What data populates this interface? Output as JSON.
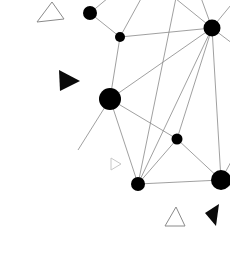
{
  "canvas": {
    "width": 230,
    "height": 267,
    "background": "#ffffff",
    "title": "node-link-graph-scatter"
  },
  "style": {
    "edge_color": "#888888",
    "edge_width": 0.8,
    "node_fill": "#000000",
    "outline_shape_stroke": "#8a8a8a",
    "outline_shape_stroke_light": "#c8c8c8",
    "filled_shape_fill": "#0a0a0a"
  },
  "chart_data": {
    "type": "scatter",
    "title": "",
    "xlabel": "",
    "ylabel": "",
    "xlim": [
      0,
      230
    ],
    "ylim": [
      0,
      267
    ],
    "grid": false,
    "legend": "none",
    "nodes": [
      {
        "id": "n1",
        "x": 90,
        "y": 13,
        "r": 7.0,
        "color": "#000000"
      },
      {
        "id": "n2",
        "x": 120,
        "y": 37,
        "r": 5.0,
        "color": "#000000"
      },
      {
        "id": "n3",
        "x": 212,
        "y": 28,
        "r": 8.5,
        "color": "#000000"
      },
      {
        "id": "n4",
        "x": 110,
        "y": 99,
        "r": 11.0,
        "color": "#000000"
      },
      {
        "id": "n5",
        "x": 177,
        "y": 139,
        "r": 5.5,
        "color": "#000000"
      },
      {
        "id": "n6",
        "x": 138,
        "y": 184,
        "r": 7.0,
        "color": "#000000"
      },
      {
        "id": "n7",
        "x": 221,
        "y": 180,
        "r": 10.0,
        "color": "#000000"
      }
    ],
    "edges": [
      {
        "from": "n1",
        "to": "n2"
      },
      {
        "from": "n2",
        "to": "n3"
      },
      {
        "from": "n2",
        "to": "n4"
      },
      {
        "from": "n3",
        "to": "n4"
      },
      {
        "from": "n3",
        "to": "n5"
      },
      {
        "from": "n3",
        "to": "n6"
      },
      {
        "from": "n3",
        "to": "n7"
      },
      {
        "from": "n4",
        "to": "n5"
      },
      {
        "from": "n4",
        "to": "n6"
      },
      {
        "from": "n5",
        "to": "n6"
      },
      {
        "from": "n5",
        "to": "n7"
      },
      {
        "from": "n6",
        "to": "n7"
      }
    ],
    "open_edges": [
      {
        "from": "n1",
        "x2": 120,
        "y2": -12
      },
      {
        "from": "n3",
        "x2": 160,
        "y2": -14
      },
      {
        "from": "n3",
        "x2": 196,
        "y2": -16
      },
      {
        "from": "n3",
        "x2": 240,
        "y2": -6
      },
      {
        "from": "n3",
        "x2": 241,
        "y2": 50
      },
      {
        "from": "n7",
        "x2": 243,
        "y2": 140
      },
      {
        "from": "n7",
        "x2": 245,
        "y2": 196
      },
      {
        "from": "n4",
        "x2": 78,
        "y2": 150
      },
      {
        "from": "n6",
        "x2": 178,
        "y2": -12
      },
      {
        "from": "n2",
        "x2": 148,
        "y2": -14
      }
    ],
    "markers": [
      {
        "id": "m1",
        "shape": "triangle",
        "style": "outline",
        "stroke": "#8a8a8a",
        "points": "37,22 52,2 64,19",
        "label": "open-triangle-top-left"
      },
      {
        "id": "m2",
        "shape": "triangle",
        "style": "filled",
        "fill": "#0a0a0a",
        "points": "59,70 80,81 60,91",
        "label": "filled-triangle-left"
      },
      {
        "id": "m3",
        "shape": "triangle",
        "style": "outline",
        "stroke": "#c8c8c8",
        "points": "111,158 121,164 111,170",
        "label": "small-open-triangle-mid"
      },
      {
        "id": "m4",
        "shape": "triangle",
        "style": "outline",
        "stroke": "#8a8a8a",
        "points": "165,226 176,207 185,226",
        "label": "open-triangle-bottom"
      },
      {
        "id": "m5",
        "shape": "triangle",
        "style": "filled",
        "fill": "#0a0a0a",
        "points": "219,204 216,226 205,213",
        "label": "filled-triangle-bottom-right"
      }
    ]
  }
}
